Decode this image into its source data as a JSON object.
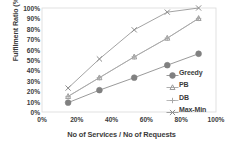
{
  "chart_data": {
    "type": "line",
    "title": "",
    "xlabel": "No of Services / No of Requests",
    "ylabel": "Fulfilment Ratio (%)",
    "xlim": [
      0,
      100
    ],
    "ylim": [
      0,
      100
    ],
    "grid": false,
    "legend_position": "inside-bottom-right",
    "x_ticks": [
      "0%",
      "20%",
      "40%",
      "60%",
      "80%",
      "100%"
    ],
    "x_tick_values": [
      0,
      20,
      40,
      60,
      80,
      100
    ],
    "y_ticks": [
      "0%",
      "10%",
      "20%",
      "30%",
      "40%",
      "50%",
      "60%",
      "70%",
      "80%",
      "90%",
      "100%"
    ],
    "y_tick_values": [
      0,
      10,
      20,
      30,
      40,
      50,
      60,
      70,
      80,
      90,
      100
    ],
    "x": [
      15,
      33,
      53,
      72,
      90
    ],
    "series": [
      {
        "name": "Greedy",
        "marker": "filled-circle",
        "color": "#808080",
        "values": [
          9,
          21,
          33,
          45,
          56
        ]
      },
      {
        "name": "PB",
        "marker": "triangle",
        "color": "#9a9a9a",
        "values": [
          15,
          33,
          53,
          71,
          90
        ]
      },
      {
        "name": "DB",
        "marker": "plus",
        "color": "#a8a8a8",
        "values": [
          15,
          33,
          53,
          71,
          90
        ]
      },
      {
        "name": "Max-Min",
        "marker": "x-cross",
        "color": "#8c8c8c",
        "values": [
          23,
          51,
          79,
          96,
          100
        ]
      }
    ]
  },
  "axis_label_color": "#3b3b3b",
  "plot_border_color": "#d9d9d9"
}
